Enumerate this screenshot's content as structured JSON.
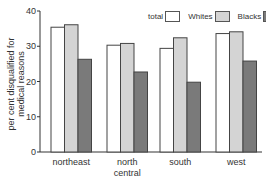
{
  "chart_data": {
    "type": "bar",
    "title": "",
    "xlabel": "",
    "ylabel": "per cent disqualified for medical reasons",
    "ylabel_lines": [
      "per cent disqualified for",
      "medical reasons"
    ],
    "categories": [
      "northeast",
      "north central",
      "south",
      "west"
    ],
    "category_lines": [
      [
        "northeast"
      ],
      [
        "north",
        "central"
      ],
      [
        "south"
      ],
      [
        "west"
      ]
    ],
    "series": [
      {
        "name": "total",
        "values": [
          35.4,
          30.3,
          29.4,
          33.6
        ],
        "color": "#ffffff"
      },
      {
        "name": "Whites",
        "values": [
          36.1,
          30.8,
          32.4,
          34.1
        ],
        "color": "#d4d4d4"
      },
      {
        "name": "Blacks",
        "values": [
          26.3,
          22.7,
          19.8,
          25.8
        ],
        "color": "#7a7a7a"
      }
    ],
    "ylim": [
      0,
      40
    ],
    "yticks": [
      0,
      10,
      20,
      30,
      40
    ],
    "grid": false,
    "legend_position": "top-right"
  }
}
